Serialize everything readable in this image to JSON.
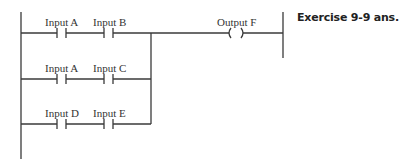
{
  "title": "Exercise 9-9 ans.",
  "rungs": [
    {
      "contacts": [
        {
          "label": "Input A",
          "type": "normally-open"
        },
        {
          "label": "Input B",
          "type": "normally-open"
        }
      ]
    },
    {
      "contacts": [
        {
          "label": "Input A",
          "type": "normally-open"
        },
        {
          "label": "Input C",
          "type": "normally-open"
        }
      ]
    },
    {
      "contacts": [
        {
          "label": "Input D",
          "type": "normally-open"
        },
        {
          "label": "Input E",
          "type": "normally-open"
        }
      ]
    }
  ],
  "output": {
    "label": "Output F",
    "type": "coil"
  },
  "colors": {
    "line": "#3a3a3a",
    "text": "#333333",
    "background": "#ffffff"
  }
}
